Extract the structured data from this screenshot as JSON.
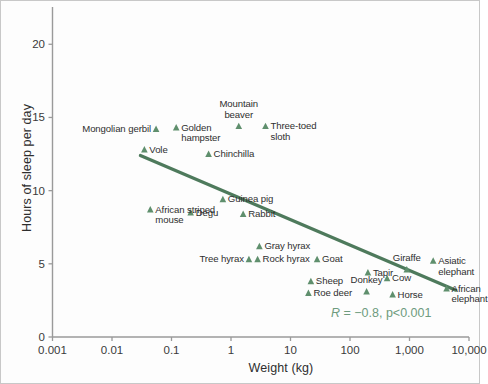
{
  "chart_data": {
    "type": "scatter",
    "title": "",
    "xlabel": "Weight (kg)",
    "ylabel": "Hours of sleep per day",
    "xscale": "log",
    "xlim": [
      0.001,
      10000
    ],
    "ylim": [
      0,
      22
    ],
    "xticks": [
      "0.001",
      "0.01",
      "0.1",
      "1",
      "10",
      "100",
      "1,000",
      "10,000"
    ],
    "xtick_values": [
      0.001,
      0.01,
      0.1,
      1,
      10,
      100,
      1000,
      10000
    ],
    "yticks": [
      "0",
      "5",
      "10",
      "15",
      "20"
    ],
    "ytick_values": [
      0,
      5,
      10,
      15,
      20
    ],
    "grid": false,
    "legend": "none",
    "marker": "triangle-up",
    "marker_color": "#5f8f6d",
    "annotation": {
      "r_prefix": "R",
      "r_text": " = −0.8, p<0.001",
      "full_text": "R = −0.8, p<0.001",
      "color": "#6e9b7e"
    },
    "trendline": {
      "color": "#4e7a5c",
      "x_start": 0.03,
      "y_start": 12.4,
      "x_end": 6000,
      "y_end": 3.2
    },
    "points": [
      {
        "name": "Mongolian gerbil",
        "weight": 0.055,
        "sleep": 14.2,
        "label_side": "left"
      },
      {
        "name": "Golden\nhampster",
        "weight": 0.12,
        "sleep": 14.3,
        "label_side": "right"
      },
      {
        "name": "Mountain\nbeaver",
        "weight": 1.35,
        "sleep": 14.4,
        "label_side": "above"
      },
      {
        "name": "Three-toed\nsloth",
        "weight": 3.8,
        "sleep": 14.4,
        "label_side": "right"
      },
      {
        "name": "Vole",
        "weight": 0.035,
        "sleep": 12.8,
        "label_side": "right"
      },
      {
        "name": "Chinchilla",
        "weight": 0.42,
        "sleep": 12.5,
        "label_side": "right"
      },
      {
        "name": "Guinea pig",
        "weight": 0.73,
        "sleep": 9.4,
        "label_side": "right"
      },
      {
        "name": "African striped\nmouse",
        "weight": 0.044,
        "sleep": 8.7,
        "label_side": "right"
      },
      {
        "name": "Degu",
        "weight": 0.21,
        "sleep": 8.5,
        "label_side": "right"
      },
      {
        "name": "Rabbit",
        "weight": 1.6,
        "sleep": 8.4,
        "label_side": "right"
      },
      {
        "name": "Gray hyrax",
        "weight": 3.0,
        "sleep": 6.2,
        "label_side": "right"
      },
      {
        "name": "Tree hyrax",
        "weight": 2.0,
        "sleep": 5.3,
        "label_side": "left"
      },
      {
        "name": "Rock hyrax",
        "weight": 2.8,
        "sleep": 5.3,
        "label_side": "right"
      },
      {
        "name": "Goat",
        "weight": 28,
        "sleep": 5.3,
        "label_side": "right"
      },
      {
        "name": "Giraffe",
        "weight": 900,
        "sleep": 4.6,
        "label_side": "above"
      },
      {
        "name": "Asiatic\nelephant",
        "weight": 2500,
        "sleep": 5.2,
        "label_side": "right"
      },
      {
        "name": "Sheep",
        "weight": 22,
        "sleep": 3.8,
        "label_side": "right"
      },
      {
        "name": "Tapir",
        "weight": 200,
        "sleep": 4.4,
        "label_side": "right"
      },
      {
        "name": "Cow",
        "weight": 420,
        "sleep": 4.0,
        "label_side": "right"
      },
      {
        "name": "Donkey",
        "weight": 190,
        "sleep": 3.1,
        "label_side": "above"
      },
      {
        "name": "Horse",
        "weight": 520,
        "sleep": 2.9,
        "label_side": "right"
      },
      {
        "name": "Roe deer",
        "weight": 20,
        "sleep": 3.0,
        "label_side": "right"
      },
      {
        "name": "African\nelephant",
        "weight": 4200,
        "sleep": 3.3,
        "label_side": "right"
      }
    ]
  },
  "axes": {
    "y_title": "Hours of sleep per day",
    "x_title": "Weight (kg)"
  }
}
